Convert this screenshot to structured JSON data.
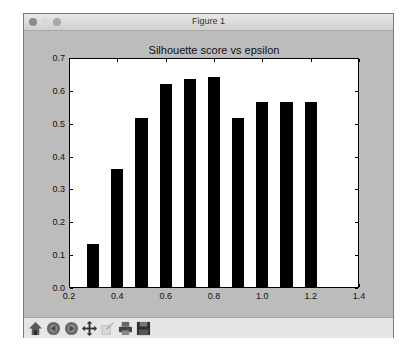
{
  "window": {
    "title": "Figure 1"
  },
  "toolbar": {
    "buttons": [
      {
        "name": "home",
        "label": "Home"
      },
      {
        "name": "back",
        "label": "Back"
      },
      {
        "name": "forward",
        "label": "Forward"
      },
      {
        "name": "pan",
        "label": "Pan"
      },
      {
        "name": "zoom",
        "label": "Zoom"
      },
      {
        "name": "subplots",
        "label": "Configure subplots"
      },
      {
        "name": "save",
        "label": "Save"
      }
    ]
  },
  "chart_data": {
    "type": "bar",
    "title": "Silhouette score vs epsilon",
    "xlabel": "",
    "ylabel": "",
    "x": [
      0.3,
      0.4,
      0.5,
      0.6,
      0.7,
      0.8,
      0.9,
      1.0,
      1.1,
      1.2
    ],
    "values": [
      0.13,
      0.36,
      0.515,
      0.618,
      0.634,
      0.638,
      0.514,
      0.563,
      0.563,
      0.563
    ],
    "bar_width": 0.05,
    "xlim": [
      0.2,
      1.4
    ],
    "ylim": [
      0.0,
      0.7
    ],
    "xticks": [
      "0.2",
      "0.4",
      "0.6",
      "0.8",
      "1.0",
      "1.2",
      "1.4"
    ],
    "yticks": [
      "0.0",
      "0.1",
      "0.2",
      "0.3",
      "0.4",
      "0.5",
      "0.6",
      "0.7"
    ],
    "bar_color": "#000000",
    "grid": false,
    "legend": null
  }
}
